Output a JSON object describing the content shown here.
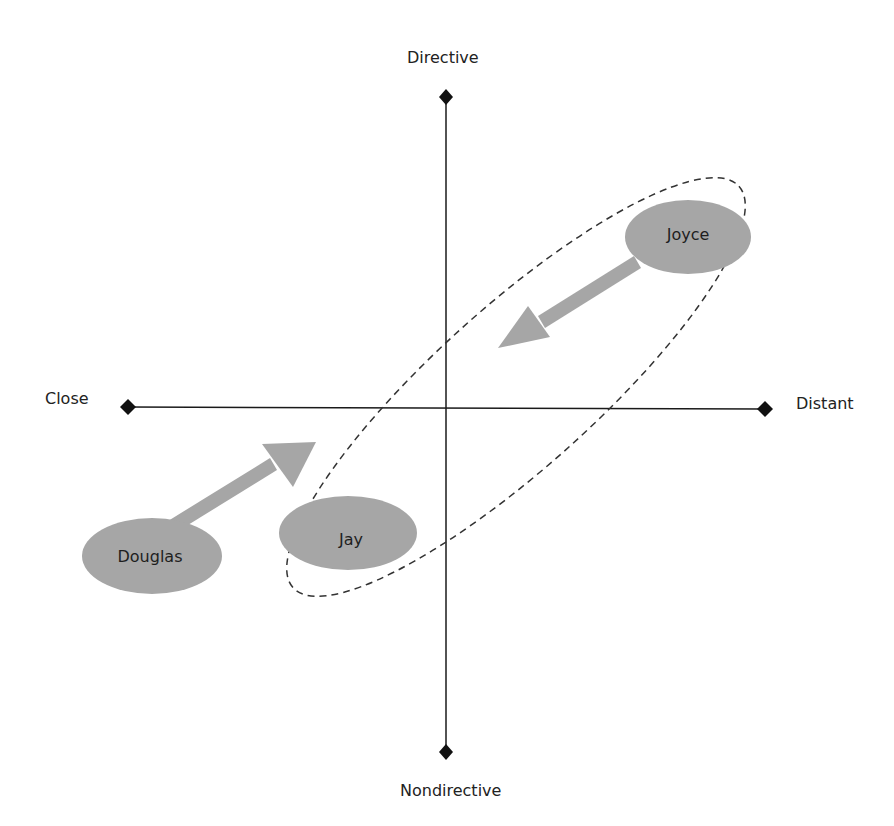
{
  "axes": {
    "top": "Directive",
    "bottom": "Nondirective",
    "left": "Close",
    "right": "Distant"
  },
  "nodes": [
    {
      "id": "joyce",
      "label": "Joyce"
    },
    {
      "id": "jay",
      "label": "Jay"
    },
    {
      "id": "douglas",
      "label": "Douglas"
    }
  ],
  "arrows": [
    {
      "from": "Joyce",
      "direction": "toward center (down-left)"
    },
    {
      "from": "Douglas",
      "direction": "toward center (up-right)"
    }
  ],
  "grouping": {
    "style": "dashed ellipse",
    "encloses": [
      "Joyce",
      "Jay"
    ]
  },
  "colors": {
    "axis": "#1a1a1a",
    "node_fill": "#a6a6a6",
    "arrow_fill": "#a6a6a6",
    "dash_stroke": "#333333"
  }
}
